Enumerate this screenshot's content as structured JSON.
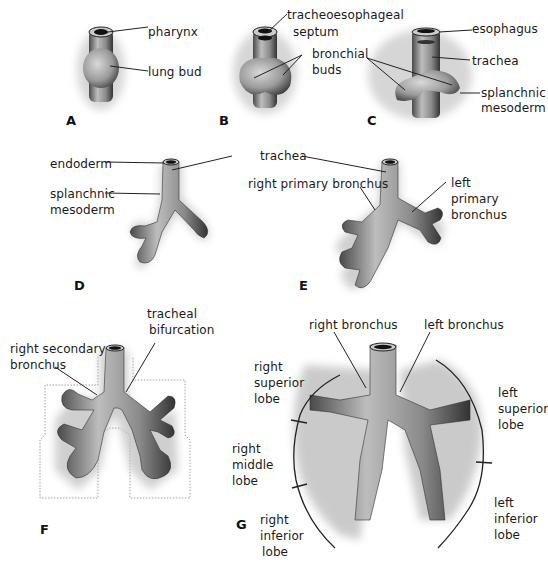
{
  "figure": {
    "panels": [
      {
        "id": "A",
        "letter": "A",
        "labels": {
          "pharynx": "pharynx",
          "lung_bud": "lung bud"
        }
      },
      {
        "id": "B",
        "letter": "B",
        "labels": {
          "septum_1": "tracheoesophageal",
          "septum_2": "septum",
          "buds_1": "bronchial",
          "buds_2": "buds"
        }
      },
      {
        "id": "C",
        "letter": "C",
        "labels": {
          "esophagus": "esophagus",
          "trachea": "trachea",
          "splanchnic": "splanchnic",
          "mesoderm": "mesoderm"
        }
      },
      {
        "id": "D",
        "letter": "D",
        "labels": {
          "endoderm": "endoderm",
          "splanchnic": "splanchnic",
          "mesoderm": "mesoderm"
        }
      },
      {
        "id": "E",
        "letter": "E",
        "labels": {
          "trachea": "trachea",
          "right_primary": "right primary bronchus",
          "left_1": "left",
          "left_2": "primary",
          "left_3": "bronchus"
        }
      },
      {
        "id": "F",
        "letter": "F",
        "labels": {
          "bif_1": "tracheal",
          "bif_2": "bifurcation",
          "sec_1": "right secondary",
          "sec_2": "bronchus"
        }
      },
      {
        "id": "G",
        "letter": "G",
        "labels": {
          "right_bronchus": "right  bronchus",
          "left_bronchus": "left  bronchus",
          "rsl_1": "right",
          "rsl_2": "superior",
          "rsl_3": "lobe",
          "rml_1": "right",
          "rml_2": "middle",
          "rml_3": "lobe",
          "ril_1": "right",
          "ril_2": "inferior",
          "ril_3": "lobe",
          "lsl_1": "left",
          "lsl_2": "superior",
          "lsl_3": "lobe",
          "lil_1": "left",
          "lil_2": "inferior",
          "lil_3": "lobe"
        }
      }
    ]
  }
}
